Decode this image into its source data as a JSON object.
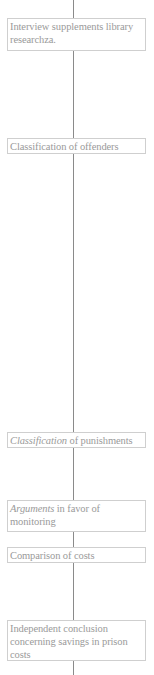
{
  "diagram": {
    "type": "vertical-flowchart",
    "colors": {
      "background": "#ffffff",
      "node_border": "#cfcfcf",
      "node_text": "#9a9a9a",
      "connector": "#8a8a8a"
    },
    "nodes": [
      {
        "id": "n1",
        "text": "Interview supplements library researchza."
      },
      {
        "id": "n2",
        "text": "Classification of offenders"
      },
      {
        "id": "n3",
        "italic_prefix": "Classification",
        "text": " of punishments"
      },
      {
        "id": "n4",
        "italic_prefix": "Arguments",
        "text": " in favor of monitoring"
      },
      {
        "id": "n5",
        "text": "Comparison of costs"
      },
      {
        "id": "n6",
        "text": "Independent conclusion concerning savings in prison costs"
      }
    ]
  }
}
